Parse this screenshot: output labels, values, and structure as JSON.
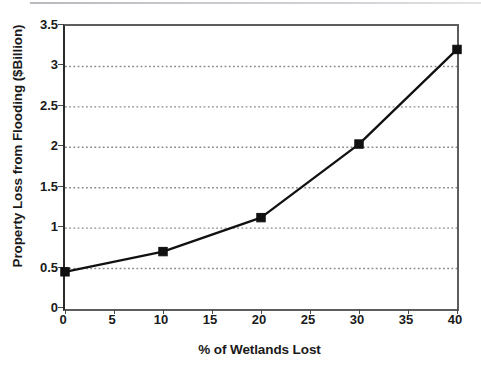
{
  "chart_data": {
    "type": "line",
    "title": "",
    "xlabel": "% of Wetlands Lost",
    "ylabel": "Property Loss from Flooding ($Billion)",
    "x": [
      0,
      10,
      20,
      30,
      40
    ],
    "values": [
      0.46,
      0.71,
      1.13,
      2.04,
      3.21
    ],
    "series": [
      {
        "name": "Property Loss from Flooding",
        "x": [
          0,
          10,
          20,
          30,
          40
        ],
        "values": [
          0.46,
          0.71,
          1.13,
          2.04,
          3.21
        ],
        "color": "#111111",
        "marker": "square"
      }
    ],
    "xlim": [
      0,
      40
    ],
    "ylim": [
      0,
      3.5
    ],
    "xticks": [
      0,
      5,
      10,
      15,
      20,
      25,
      30,
      35,
      40
    ],
    "yticks": [
      0,
      0.5,
      1,
      1.5,
      2,
      2.5,
      3,
      3.5
    ],
    "xtick_labels": [
      "0",
      "5",
      "10",
      "15",
      "20",
      "25",
      "30",
      "35",
      "40"
    ],
    "ytick_labels": [
      "0",
      "0.5",
      "1",
      "1.5",
      "2",
      "2.5",
      "3",
      "3.5"
    ],
    "grid": {
      "horizontal": true,
      "vertical": false,
      "style": "dotted",
      "color": "#8a8a8a",
      "at": [
        0.5,
        1,
        1.5,
        2,
        2.5,
        3
      ]
    },
    "legend": null,
    "legend_position": "none",
    "annotations": [],
    "colors": {
      "line": "#111111",
      "marker": "#111111",
      "grid": "#8a8a8a",
      "axis": "#4a4a4a",
      "background": "#ffffff",
      "text": "#1a1a1a"
    }
  }
}
